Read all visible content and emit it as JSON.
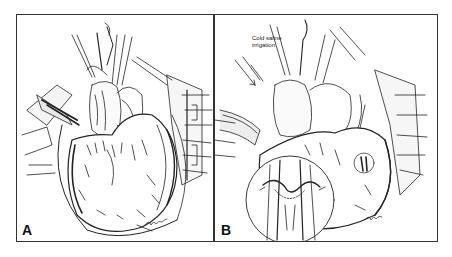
{
  "figure": {
    "type": "surgical illustration",
    "panels": [
      {
        "id": "A",
        "label": "A",
        "content": "Exposed heart in open chest with retractors and cannulas",
        "signature": "artist signature"
      },
      {
        "id": "B",
        "label": "B",
        "content": "Heart with cold saline irrigation and magnified inset of vessel anastomosis",
        "annotation": {
          "line1": "Cold saline",
          "line2": "irrigation"
        },
        "inset": "magnified circular detail of anastomosis",
        "signature": "artist signature"
      }
    ]
  },
  "colors": {
    "ink": "#222222",
    "border": "#333333",
    "paper": "#ffffff"
  }
}
